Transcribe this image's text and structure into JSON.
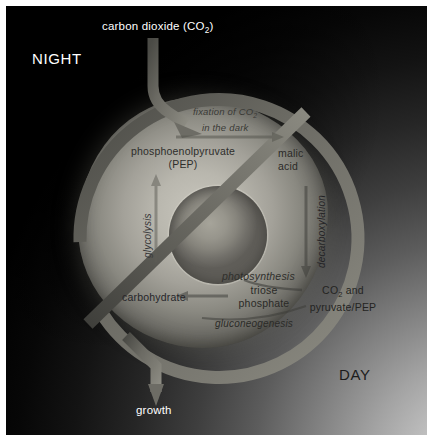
{
  "figure": {
    "type": "diagram",
    "phases": {
      "night_label": "NIGHT",
      "day_label": "DAY"
    },
    "inputs": {
      "co2_label": "carbon dioxide (CO",
      "co2_sub": "2",
      "co2_close": ")"
    },
    "outputs": {
      "growth_label": "growth"
    },
    "processes": {
      "fixation_line1": "fixation of CO",
      "fixation_sub": "2",
      "fixation_line2": "in the dark",
      "glycolysis": "glycolysis",
      "decarboxylation": "decarboxylation",
      "photosynthesis": "photosynthesis",
      "gluconeogenesis": "gluconeogenesis"
    },
    "metabolites": {
      "pep_line1": "phosphoenolpyruvate",
      "pep_line2": "(PEP)",
      "malic_line1": "malic",
      "malic_line2": "acid",
      "triose_line1": "triose",
      "triose_line2": "phosphate",
      "co2pyr_line1": "CO",
      "co2pyr_sub": "2",
      "co2pyr_line1b": " and",
      "co2pyr_line2": "pyruvate/PEP",
      "carbohydrate": "carbohydrate"
    },
    "colors": {
      "night": "#000000",
      "day": "#d9d9d9",
      "cell": "#b9b7ae",
      "nucleus": "#97958c",
      "arrow": "#6e6d66"
    }
  }
}
